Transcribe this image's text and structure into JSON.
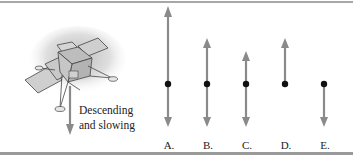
{
  "figure": {
    "illustration": {
      "subject": "lunar lander",
      "caption_line1": "Descending",
      "caption_line2": "and slowing",
      "motion_arrow": "down"
    },
    "options": [
      {
        "label": "A.",
        "up_length": "long",
        "down_length": "short",
        "x": 168,
        "up_tip": 8,
        "dot": 84,
        "down_tip": 125
      },
      {
        "label": "B.",
        "up_length": "medium",
        "down_length": "short",
        "x": 207,
        "up_tip": 39,
        "dot": 84,
        "down_tip": 125
      },
      {
        "label": "C.",
        "up_length": "short",
        "down_length": "short",
        "x": 246,
        "up_tip": 52,
        "dot": 84,
        "down_tip": 125
      },
      {
        "label": "D.",
        "up_length": "medium",
        "down_length": "none",
        "x": 285,
        "up_tip": 39,
        "dot": 84,
        "down_tip": null
      },
      {
        "label": "E.",
        "up_length": "none",
        "down_length": "short",
        "x": 324,
        "up_tip": null,
        "dot": 84,
        "down_tip": 125
      }
    ],
    "colors": {
      "arrow": "#8a8a8a",
      "dot": "#111111",
      "rule": "#a0a0a0",
      "text": "#222222"
    }
  }
}
